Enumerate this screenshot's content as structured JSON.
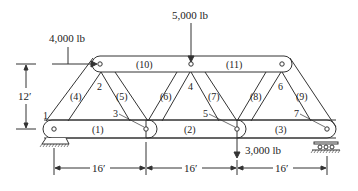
{
  "diagram": {
    "type": "truss",
    "loads": [
      {
        "label": "4,000 lb",
        "joint": "2",
        "direction": "horizontal-right"
      },
      {
        "label": "5,000 lb",
        "joint": "4",
        "direction": "down"
      },
      {
        "label": "3,000 lb",
        "joint": "5",
        "direction": "down"
      }
    ],
    "joints": [
      "1",
      "2",
      "3",
      "4",
      "5",
      "6",
      "7"
    ],
    "members": [
      "(1)",
      "(2)",
      "(3)",
      "(4)",
      "(5)",
      "(6)",
      "(7)",
      "(8)",
      "(9)",
      "(10)",
      "(11)"
    ],
    "dimensions": {
      "height": "12′",
      "spans": [
        "16′",
        "16′",
        "16′"
      ]
    },
    "supports": {
      "left": "pin",
      "right": "roller"
    }
  }
}
